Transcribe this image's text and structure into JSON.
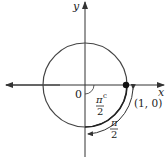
{
  "diagram": {
    "axis_labels": {
      "x": "x",
      "y": "y"
    },
    "origin_label": "0",
    "point_label": "(1, 0)",
    "angle_label": {
      "numerator": "π",
      "denominator": "2",
      "superscript": "c"
    },
    "arc_label": {
      "numerator": "π",
      "denominator": "2"
    },
    "colors": {
      "circle": "#444444",
      "axes": "#333333",
      "point": "#111111"
    }
  }
}
